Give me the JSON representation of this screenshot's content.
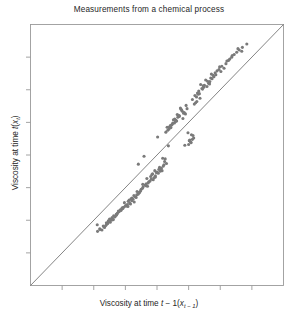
{
  "chart_data": {
    "type": "scatter",
    "title": "Measurements from a chemical process",
    "xlabel_plain": "Viscosity at time t - 1(x_{t-1})",
    "ylabel_plain": "Viscosity at time t(x_t)",
    "xlabel_parts": {
      "prefix": "Viscosity at time ",
      "var1": "t",
      "middle": " − 1(",
      "var2": "x",
      "sub2": "t − 1",
      "suffix": ")"
    },
    "ylabel_parts": {
      "prefix": "Viscosity at time ",
      "var1": "t",
      "middle": "(",
      "var2": "x",
      "sub2": "t",
      "suffix": ")"
    },
    "grid": false,
    "legend": null,
    "xlim": [
      0,
      8
    ],
    "ylim": [
      0,
      8
    ],
    "xticks": [
      1,
      2,
      3,
      4,
      5,
      6,
      7
    ],
    "yticks": [
      1,
      2,
      3,
      4,
      5,
      6,
      7
    ],
    "tick_labels_shown": false,
    "annotations": [
      {
        "type": "reference-line",
        "name": "identity-line",
        "description": "45-degree line y = x drawn corner to corner",
        "from": [
          0,
          0
        ],
        "to": [
          8,
          8
        ],
        "color": "#6e6e6e"
      }
    ],
    "marker": {
      "shape": "circle",
      "color": "#7a7a7a",
      "size_px": 3.1,
      "edge": "none"
    },
    "x": [
      3.55,
      4.32,
      3.21,
      4.88,
      2.57,
      5.12,
      3.93,
      2.11,
      4.55,
      5.8,
      3.06,
      4.02,
      2.75,
      5.34,
      3.68,
      4.71,
      2.4,
      5.02,
      3.41,
      4.18,
      6.05,
      3.84,
      2.92,
      4.46,
      5.58,
      3.12,
      4.95,
      2.63,
      5.25,
      3.74,
      4.28,
      2.19,
      5.67,
      3.37,
      4.6,
      6.21,
      2.86,
      5.09,
      3.59,
      4.39,
      2.46,
      5.44,
      3.98,
      4.8,
      3.27,
      6.38,
      2.71,
      5.16,
      4.08,
      3.5,
      4.66,
      2.33,
      5.72,
      3.8,
      4.5,
      6.52,
      3.02,
      5.28,
      2.58,
      4.24,
      3.65,
      5.9,
      4.84,
      2.97,
      5.38,
      3.44,
      4.12,
      6.7,
      2.26,
      5.54,
      3.88,
      4.42,
      3.18,
      5.06,
      2.8,
      4.74,
      6.12,
      3.56,
      5.2,
      4.0,
      2.52,
      5.63,
      3.72,
      4.34,
      3.09,
      6.3,
      2.68,
      4.92,
      5.48,
      3.3,
      4.56,
      2.12,
      5.84,
      3.95,
      4.2,
      6.6,
      2.88,
      5.14,
      3.48,
      4.64,
      2.41,
      5.32,
      4.06,
      3.62,
      5.96,
      2.74,
      4.78,
      3.24,
      6.44,
      5.04,
      3.9,
      4.48,
      2.62,
      5.7,
      3.14,
      4.86,
      2.34,
      5.26,
      3.78,
      4.3,
      6.18,
      2.94,
      5.6,
      3.4,
      4.7,
      3.0,
      5.42,
      2.48,
      4.14,
      6.84,
      3.66,
      5.08,
      4.38,
      2.78,
      5.78,
      3.34,
      4.58,
      2.2,
      5.18,
      3.86,
      4.26,
      6.26,
      3.04,
      5.5,
      2.66,
      4.98,
      3.54,
      4.44,
      5.98,
      2.84,
      4.16,
      3.2,
      5.36,
      6.68,
      2.44,
      4.82,
      3.7,
      5.12,
      4.52,
      2.56,
      3.44,
      5.86,
      4.1,
      6.02,
      2.3,
      4.9,
      3.28,
      5.22,
      4.62,
      3.08,
      5.66,
      2.72,
      4.36,
      3.94,
      6.36,
      5.0,
      2.38,
      4.68,
      3.36,
      5.74,
      4.22,
      2.9,
      5.46,
      3.82,
      4.76,
      3.16,
      6.56,
      2.5,
      5.3,
      4.04
    ],
    "y": [
      3.1,
      4.85,
      2.68,
      4.3,
      2.05,
      5.7,
      3.52,
      1.86,
      4.98,
      6.4,
      2.48,
      4.55,
      2.22,
      5.88,
      3.28,
      5.2,
      1.92,
      4.44,
      3.72,
      3.9,
      6.72,
      3.4,
      2.36,
      4.92,
      6.1,
      2.62,
      5.42,
      2.14,
      5.78,
      3.18,
      4.7,
      1.74,
      6.25,
      2.88,
      5.06,
      6.88,
      2.3,
      4.62,
      3.96,
      4.86,
      1.98,
      6.02,
      3.46,
      5.34,
      2.76,
      7.05,
      2.18,
      4.52,
      3.62,
      2.95,
      5.16,
      1.8,
      6.48,
      3.34,
      4.98,
      7.15,
      2.44,
      5.9,
      2.08,
      3.8,
      3.06,
      6.58,
      5.28,
      2.54,
      6.16,
      2.84,
      3.58,
      7.3,
      1.7,
      6.3,
      3.24,
      4.9,
      2.66,
      4.4,
      2.26,
      5.44,
      6.66,
      3.02,
      5.82,
      3.48,
      1.94,
      6.2,
      3.14,
      4.76,
      2.58,
      6.94,
      2.12,
      5.52,
      6.08,
      2.72,
      5.1,
      1.66,
      6.52,
      3.36,
      3.66,
      7.22,
      2.34,
      4.6,
      2.9,
      5.24,
      1.88,
      5.96,
      3.56,
      3.08,
      6.62,
      2.2,
      5.38,
      2.64,
      7.08,
      4.46,
      3.3,
      4.94,
      2.02,
      6.36,
      2.52,
      5.3,
      1.78,
      5.64,
      3.2,
      3.74,
      6.8,
      2.4,
      6.26,
      2.8,
      5.18,
      2.44,
      6.04,
      1.96,
      3.6,
      7.4,
      3.12,
      4.38,
      4.8,
      2.28,
      6.44,
      2.7,
      5.02,
      1.72,
      5.56,
      3.42,
      3.88,
      6.9,
      2.46,
      6.14,
      2.1,
      4.68,
      2.98,
      4.84,
      6.7,
      2.32,
      3.52,
      2.6,
      5.74,
      7.18,
      1.9,
      5.12,
      3.04,
      4.48,
      5.08,
      2.0,
      2.86,
      6.46,
      3.5,
      6.56,
      1.82,
      5.26,
      2.56,
      5.6,
      5.04,
      2.42,
      6.18,
      2.16,
      4.28,
      3.32,
      7.0,
      4.32,
      1.84,
      5.22,
      2.78,
      6.34,
      3.7,
      2.38,
      6.12,
      3.26,
      5.4,
      2.5,
      7.26,
      2.04,
      5.86,
      3.44
    ]
  },
  "frame": {
    "border_color": "#9a9a9a",
    "background": "#ffffff"
  }
}
